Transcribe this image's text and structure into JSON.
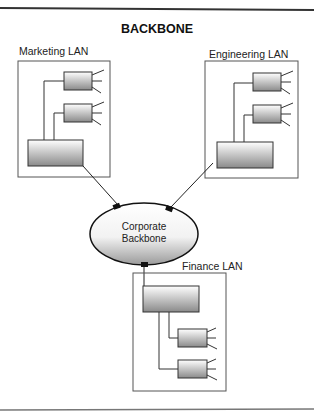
{
  "diagram": {
    "title": "BACKBONE",
    "center": {
      "label_line1": "Corporate",
      "label_line2": "Backbone"
    },
    "lans": [
      {
        "name": "Marketing LAN",
        "hubs": 2,
        "position": "top-left"
      },
      {
        "name": "Engineering LAN",
        "hubs": 2,
        "position": "top-right"
      },
      {
        "name": "Finance LAN",
        "hubs": 2,
        "position": "bottom"
      }
    ],
    "connections": [
      {
        "from": "Marketing LAN",
        "to": "Corporate Backbone"
      },
      {
        "from": "Engineering LAN",
        "to": "Corporate Backbone"
      },
      {
        "from": "Finance LAN",
        "to": "Corporate Backbone"
      }
    ]
  }
}
